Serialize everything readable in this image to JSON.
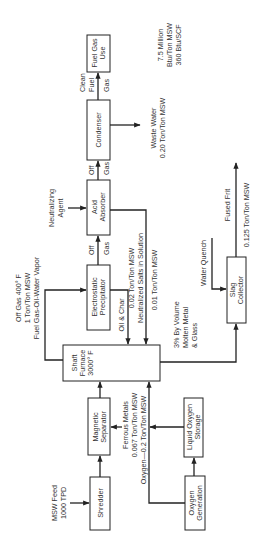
{
  "diagram": {
    "orientation": "rotated 90 degrees counter-clockwise",
    "boxes": {
      "shredder": [
        "Shredder"
      ],
      "magnetic_separator": [
        "Magnetic",
        "Separator"
      ],
      "shaft_furnace": [
        "Shaft",
        "Furnace",
        "3000° F"
      ],
      "precipitator": [
        "Electrostatic",
        "Precipitator"
      ],
      "acid_absorber": [
        "Acid",
        "Absorber"
      ],
      "condenser": [
        "Condenser"
      ],
      "fuel_gas_use": [
        "Fuel Gas",
        "Use"
      ],
      "slag_collector": [
        "Slag",
        "Collector"
      ],
      "oxygen_generation": [
        "Oxygen",
        "Generation"
      ],
      "liquid_oxygen_storage": [
        "Liquid Oxygen",
        "Storage"
      ]
    },
    "labels": {
      "msw_feed": [
        "MSW Feed",
        "1000 TPD"
      ],
      "ferrous": [
        "Ferrous Metals",
        "0.067 Ton/Ton MSW"
      ],
      "oxygen": "Oxygen—0.2 Ton/Ton MSW",
      "off_gas_furnace": [
        "Off Gas   400° F",
        "1 Ton/Ton MSW",
        "Fuel Gas-Oil-Water Vapor"
      ],
      "oil_char": "Oil & Char",
      "neutralized": [
        "0.02 Ton/Ton MSW",
        "Neutralized Salts in Solution"
      ],
      "tiny_flow": "0.01 Ton/Ton MSW",
      "off_gas_1": [
        "Off",
        "Gas"
      ],
      "off_gas_2": [
        "Off",
        "Gas"
      ],
      "neutralizing_agent": [
        "Neutralizing",
        "Agent"
      ],
      "clean_fuel_gas": [
        "Clean",
        "Fuel",
        "Gas"
      ],
      "energy": [
        "7.5 Million",
        "Btu/Ton MSW",
        "360 Btu/SCF"
      ],
      "waste_water": [
        "Waste Water",
        "0.20 Ton/Ton MSW"
      ],
      "molten": [
        "3% By Volume",
        "Molten Metal",
        "&   Glass"
      ],
      "water_quench": "Water Quench",
      "fused_frit": "Fused Frit",
      "frit_rate": "0.125 Ton/Ton MSW"
    }
  }
}
